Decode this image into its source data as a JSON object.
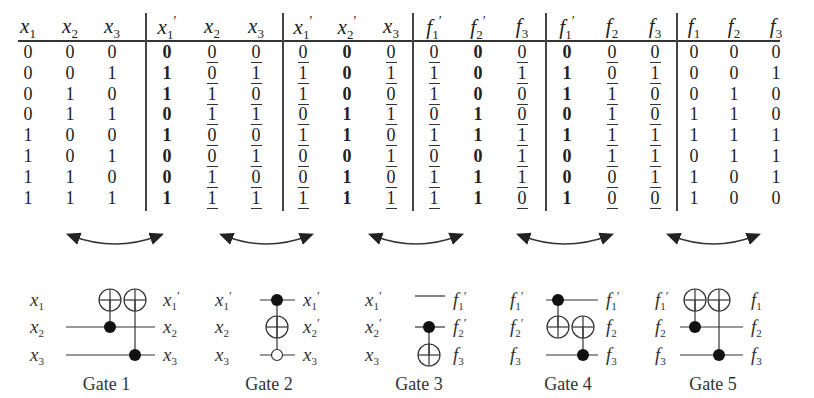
{
  "figure": {
    "column_groups": [
      {
        "headers": [
          "x1",
          "x2",
          "x3"
        ],
        "bold_col": -1,
        "underline_cols": []
      },
      {
        "headers": [
          "x1'",
          "x2",
          "x3"
        ],
        "bold_col": 0,
        "underline_cols": [
          1,
          2
        ]
      },
      {
        "headers": [
          "x1'",
          "x2'",
          "x3"
        ],
        "bold_col": 1,
        "underline_cols": [
          0,
          2
        ]
      },
      {
        "headers": [
          "f1'",
          "f2'",
          "f3"
        ],
        "bold_col": 1,
        "underline_cols": [
          0,
          2
        ]
      },
      {
        "headers": [
          "f1'",
          "f2",
          "f3"
        ],
        "bold_col": 0,
        "underline_cols": [
          1,
          2
        ]
      },
      {
        "headers": [
          "f1",
          "f2",
          "f3"
        ],
        "bold_col": -1,
        "underline_cols": []
      }
    ],
    "rows": [
      [
        "0",
        "0",
        "0",
        "0",
        "0",
        "0",
        "0",
        "0",
        "0",
        "0",
        "0",
        "0",
        "0",
        "0",
        "0",
        "0",
        "0",
        "0"
      ],
      [
        "0",
        "0",
        "1",
        "1",
        "0",
        "1",
        "1",
        "0",
        "1",
        "1",
        "0",
        "1",
        "1",
        "0",
        "1",
        "0",
        "0",
        "1"
      ],
      [
        "0",
        "1",
        "0",
        "1",
        "1",
        "0",
        "1",
        "0",
        "0",
        "1",
        "0",
        "0",
        "1",
        "1",
        "0",
        "0",
        "1",
        "0"
      ],
      [
        "0",
        "1",
        "1",
        "0",
        "1",
        "1",
        "0",
        "1",
        "1",
        "0",
        "1",
        "0",
        "0",
        "1",
        "0",
        "1",
        "1",
        "0"
      ],
      [
        "1",
        "0",
        "0",
        "1",
        "0",
        "0",
        "1",
        "1",
        "0",
        "1",
        "1",
        "1",
        "1",
        "1",
        "1",
        "1",
        "1",
        "1"
      ],
      [
        "1",
        "0",
        "1",
        "0",
        "0",
        "1",
        "0",
        "0",
        "1",
        "0",
        "0",
        "1",
        "0",
        "1",
        "1",
        "0",
        "1",
        "1"
      ],
      [
        "1",
        "1",
        "0",
        "0",
        "1",
        "0",
        "0",
        "1",
        "0",
        "1",
        "1",
        "1",
        "0",
        "0",
        "1",
        "1",
        "0",
        "1"
      ],
      [
        "1",
        "1",
        "1",
        "1",
        "1",
        "1",
        "1",
        "1",
        "1",
        "1",
        "1",
        "0",
        "1",
        "0",
        "0",
        "1",
        "0",
        "0"
      ]
    ],
    "gates": [
      {
        "label": "Gate 1",
        "inputs": [
          "x1",
          "x2",
          "x3"
        ],
        "outputs": [
          "x1'",
          "x2",
          "x3"
        ],
        "description": "Two CNOTs targeting line 1: controls on line 2 and line 3"
      },
      {
        "label": "Gate 2",
        "inputs": [
          "x1'",
          "x2",
          "x3"
        ],
        "outputs": [
          "x1'",
          "x2'",
          "x3"
        ],
        "description": "Toffoli-like: target line 2, positive control line 1, negative control line 3"
      },
      {
        "label": "Gate 3",
        "inputs": [
          "x1'",
          "x2'",
          "x3"
        ],
        "outputs": [
          "f1'",
          "f2'",
          "f3"
        ],
        "description": "CNOT: control line 2, target line 3"
      },
      {
        "label": "Gate 4",
        "inputs": [
          "f1'",
          "f2'",
          "f3"
        ],
        "outputs": [
          "f1'",
          "f2",
          "f3"
        ],
        "description": "Two CNOTs targeting line 2: controls on line 1 and line 3"
      },
      {
        "label": "Gate 5",
        "inputs": [
          "f1'",
          "f2",
          "f3"
        ],
        "outputs": [
          "f1",
          "f2",
          "f3"
        ],
        "description": "Two CNOTs targeting line 1: controls on line 2 and line 3"
      }
    ]
  }
}
